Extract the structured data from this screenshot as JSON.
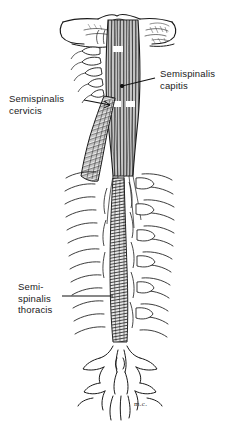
{
  "figure": {
    "orientation": "posterior view",
    "background_color": "#ffffff",
    "ink_color": "#1a1a1a",
    "signature": "m.c."
  },
  "labels": [
    {
      "id": "capitis",
      "lines": [
        "Semispinalis",
        "capitis"
      ],
      "line1": "Semispinalis",
      "line2": "capitis",
      "side": "right",
      "text_x": 160,
      "text_y": 68,
      "leader": {
        "x1": 155,
        "y1": 78,
        "x2": 120,
        "y2": 87,
        "endpoint": "dot"
      }
    },
    {
      "id": "cervicis",
      "lines": [
        "Semispinalis",
        "cervicis"
      ],
      "line1": "Semispinalis",
      "line2": "cervicis",
      "side": "left",
      "text_x": 9,
      "text_y": 93,
      "leader": {
        "x1": 84,
        "y1": 100,
        "x2": 112,
        "y2": 106,
        "endpoint": "arrow"
      }
    },
    {
      "id": "thoracis",
      "lines": [
        "Semi-",
        "spinalis",
        "thoracis"
      ],
      "line1": "Semi-",
      "line2": "spinalis",
      "line3": "thoracis",
      "side": "left",
      "text_x": 18,
      "text_y": 281,
      "leader": {
        "x1": 62,
        "y1": 296,
        "x2": 113,
        "y2": 296,
        "endpoint": "plain"
      }
    }
  ],
  "anatomy": {
    "structures": [
      "occipital bone",
      "mastoid process left",
      "mastoid process right",
      "cervical vertebrae",
      "thoracic vertebrae",
      "ribs",
      "transverse processes",
      "spinous processes",
      "semispinalis capitis muscle",
      "semispinalis cervicis muscle",
      "semispinalis thoracis muscle",
      "tendinous intersection"
    ]
  }
}
